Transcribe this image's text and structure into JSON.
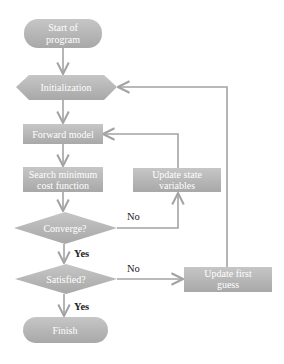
{
  "diagram": {
    "type": "flowchart",
    "colors": {
      "node_fill_top": "#c4c4c4",
      "node_fill_bottom": "#a9a9a9",
      "node_text": "#ffffff",
      "edge": "#a3a3a3",
      "label_text": "#222222"
    },
    "nodes": {
      "start": {
        "shape": "terminator",
        "line1": "Start of",
        "line2": "program"
      },
      "init": {
        "shape": "preparation",
        "label": "Initialization"
      },
      "forward": {
        "shape": "process",
        "label": "Forward model"
      },
      "search": {
        "shape": "process",
        "line1": "Search minimum",
        "line2": "cost function"
      },
      "converge": {
        "shape": "decision",
        "label": "Converge?"
      },
      "satisfied": {
        "shape": "decision",
        "label": "Satisfied?"
      },
      "finish": {
        "shape": "terminator",
        "label": "Finish"
      },
      "update_state": {
        "shape": "process",
        "line1": "Update state",
        "line2": "variables"
      },
      "update_guess": {
        "shape": "process",
        "line1": "Update first",
        "line2": "guess"
      }
    },
    "edges": [
      {
        "from": "start",
        "to": "init",
        "label": ""
      },
      {
        "from": "init",
        "to": "forward",
        "label": ""
      },
      {
        "from": "forward",
        "to": "search",
        "label": ""
      },
      {
        "from": "search",
        "to": "converge",
        "label": ""
      },
      {
        "from": "converge",
        "to": "satisfied",
        "label": "Yes"
      },
      {
        "from": "converge",
        "to": "update_state",
        "label": "No"
      },
      {
        "from": "update_state",
        "to": "forward",
        "label": ""
      },
      {
        "from": "satisfied",
        "to": "finish",
        "label": "Yes"
      },
      {
        "from": "satisfied",
        "to": "update_guess",
        "label": "No"
      },
      {
        "from": "update_guess",
        "to": "init",
        "label": ""
      }
    ],
    "labels": {
      "converge_no": "No",
      "converge_yes": "Yes",
      "satisfied_no": "No",
      "satisfied_yes": "Yes"
    }
  }
}
